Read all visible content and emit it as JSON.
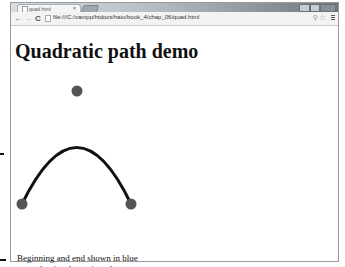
{
  "browser": {
    "tab_title": "quad.html",
    "tab_close": "×",
    "url": "file:///C:/xampp/htdocs/haio/book_4/chap_06/quad.html",
    "back": "←",
    "forward": "→",
    "reload": "C",
    "zoom_icon": "⚲",
    "star_icon": "☆"
  },
  "page": {
    "title": "Quadratic path demo",
    "caption_line1": "Beginning and end shown in blue",
    "caption_line2": "control point shown in red"
  },
  "canvas": {
    "start_point": {
      "x": 21,
      "y": 203
    },
    "end_point": {
      "x": 130,
      "y": 203
    },
    "control_point": {
      "x": 76,
      "y": 90
    },
    "point_color": "#555555",
    "curve_color": "#111111",
    "curve_width": 3,
    "point_radius": 5.5
  }
}
